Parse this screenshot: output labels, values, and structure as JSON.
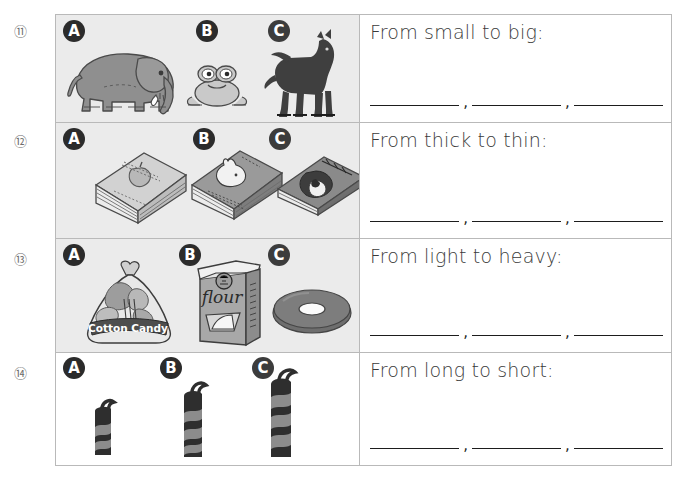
{
  "worksheet": {
    "title": "Comparing Sizes Worksheet",
    "option_labels": [
      "A",
      "B",
      "C"
    ],
    "comma": ","
  },
  "rows": [
    {
      "number": "⑪",
      "prompt": "From small to big:",
      "background": "#ebebeb",
      "items": [
        {
          "label": "A",
          "name": "elephant",
          "color": "#8f8f8f"
        },
        {
          "label": "B",
          "name": "frog",
          "color": "#c9c9c9"
        },
        {
          "label": "C",
          "name": "horse",
          "color": "#3f3f3f"
        }
      ],
      "blanks": [
        "",
        "",
        ""
      ]
    },
    {
      "number": "⑫",
      "prompt": "From thick to thin:",
      "background": "#ebebeb",
      "items": [
        {
          "label": "A",
          "name": "thick-book",
          "color": "#c2c2c2",
          "cover_text": "apple"
        },
        {
          "label": "B",
          "name": "medium-book",
          "color": "#9a9a9a",
          "cover_text": "rabbit"
        },
        {
          "label": "C",
          "name": "thin-book",
          "color": "#8a8a8a",
          "cover_text": "girl"
        }
      ],
      "blanks": [
        "",
        "",
        ""
      ]
    },
    {
      "number": "⑬",
      "prompt": "From light to heavy:",
      "background": "#ebebeb",
      "items": [
        {
          "label": "A",
          "name": "cotton-candy-bag",
          "color": "#b5b5b5",
          "cover_text": "Cotton Candy"
        },
        {
          "label": "B",
          "name": "flour-bag",
          "color": "#a8a8a8",
          "cover_text": "flour"
        },
        {
          "label": "C",
          "name": "donut",
          "color": "#6e6e6e"
        }
      ],
      "blanks": [
        "",
        "",
        ""
      ]
    },
    {
      "number": "⑭",
      "prompt": "From long to short:",
      "background": "#ffffff",
      "items": [
        {
          "label": "A",
          "name": "short-candle",
          "color": "#2e2e2e"
        },
        {
          "label": "B",
          "name": "medium-candle",
          "color": "#2e2e2e"
        },
        {
          "label": "C",
          "name": "long-candle",
          "color": "#2e2e2e"
        }
      ],
      "blanks": [
        "",
        "",
        ""
      ]
    }
  ]
}
